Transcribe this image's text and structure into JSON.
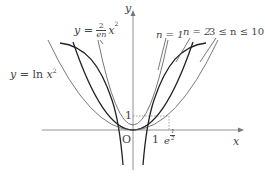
{
  "figure": {
    "axes": {
      "x_label": "x",
      "y_label": "y",
      "origin_label": "O",
      "x_tick_1": "1",
      "x_tick_e_base": "e",
      "x_tick_e_exp": "1/2",
      "x_tick_e_exp_num": "1",
      "x_tick_e_exp_den": "2",
      "y_tick_1": "1"
    },
    "labels": {
      "ln_curve": {
        "prefix": "y = ln ",
        "var": "x",
        "exp": "2"
      },
      "parabola": {
        "prefix": "y =",
        "num": "2",
        "den": "en",
        "var": "x",
        "exp": "2"
      },
      "n1": "n = 1",
      "n2": "n = 2",
      "n3_10": "3 ≤ n ≤ 10"
    },
    "colors": {
      "dark_curve": "#222222",
      "thin_curve": "#555555",
      "axis": "#777777",
      "text": "#444444"
    }
  }
}
